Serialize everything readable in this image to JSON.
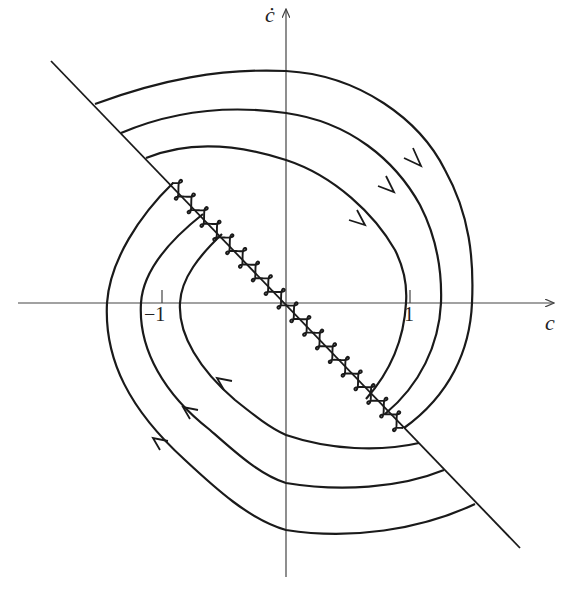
{
  "diagram": {
    "type": "phase-portrait",
    "axes": {
      "x_label": "c",
      "y_label": "ċ",
      "x_ticks": [
        {
          "label": "−1",
          "value": -1
        },
        {
          "label": "1",
          "value": 1
        }
      ]
    },
    "elements": {
      "switching_line": "diagonal line through origin with negative slope",
      "chattering_segment": "oscillating (wavy) trajectory along the switching line between the inner trajectory endpoints",
      "trajectories_upper_right": 3,
      "trajectories_lower_left": 3,
      "arrow_direction": "clockwise"
    },
    "colors": {
      "stroke": "#1a1a1a",
      "axis": "#444444",
      "background": "#ffffff"
    }
  }
}
